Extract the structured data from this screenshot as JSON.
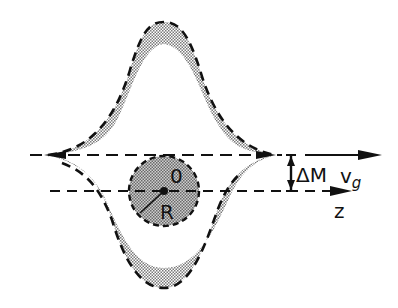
{
  "labels": {
    "origin": "0",
    "radius": "R",
    "delta_m": "ΔM",
    "velocity": "v",
    "velocity_sub": "g",
    "axis": "z"
  },
  "colors": {
    "ink": "#111111",
    "band_fill": "#b8b8b8",
    "circle_fill": "#a8a8a8",
    "background": "#ffffff"
  }
}
